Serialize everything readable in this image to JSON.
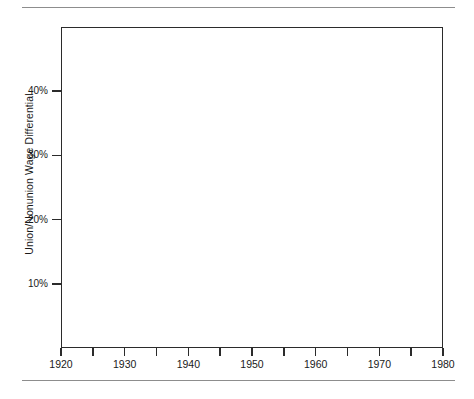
{
  "figure": {
    "has_top_rule": true,
    "has_bottom_rule": true,
    "rule_color": "#8d8d8d",
    "frame_color": "#2b2b2b",
    "background": "#ffffff"
  },
  "chart_data": {
    "type": "bar",
    "title": "",
    "subtitle": "",
    "xlabel": "",
    "ylabel": "Union/Nonunion Wage Differential",
    "xlim": [
      1920,
      1980
    ],
    "ylim": [
      0,
      50
    ],
    "grid": false,
    "legend": null,
    "y_tick_labels": [
      "10%",
      "20%",
      "30%",
      "40%"
    ],
    "y_ticks": [
      10,
      20,
      30,
      40
    ],
    "x_tick_labels": [
      "1920",
      "1930",
      "1940",
      "1950",
      "1960",
      "1970",
      "1980"
    ],
    "x_ticks": [
      1920,
      1930,
      1940,
      1950,
      1960,
      1970,
      1980
    ],
    "x_minor_ticks": [
      1925,
      1935,
      1945,
      1955,
      1965,
      1975
    ],
    "bar_width_years": 5,
    "categories": [
      "1920-1925",
      "1925-1930",
      "1930-1935",
      "1935-1940",
      "1940-1945",
      "1945-1950",
      "1950-1955",
      "1955-1960",
      "1960-1965",
      "1965-1970",
      "1970-1975",
      "1975-1980"
    ],
    "values": [
      17,
      26,
      46,
      22,
      6,
      2,
      12,
      16,
      25,
      19,
      19,
      30
    ],
    "data_labels": [
      "17%",
      "26%",
      "46%",
      "22%",
      "6%",
      "2%",
      "12%",
      "16%",
      "25%",
      "19%",
      "19%",
      "30%"
    ],
    "bars": [
      {
        "start": 1920,
        "end": 1925,
        "value": 17,
        "label": "17%"
      },
      {
        "start": 1925,
        "end": 1930,
        "value": 26,
        "label": "26%"
      },
      {
        "start": 1930,
        "end": 1935,
        "value": 46,
        "label": "46%"
      },
      {
        "start": 1935,
        "end": 1940,
        "value": 22,
        "label": "22%"
      },
      {
        "start": 1940,
        "end": 1945,
        "value": 6,
        "label": "6%"
      },
      {
        "start": 1945,
        "end": 1950,
        "value": 2,
        "label": "2%"
      },
      {
        "start": 1950,
        "end": 1955,
        "value": 12,
        "label": "12%"
      },
      {
        "start": 1955,
        "end": 1960,
        "value": 16,
        "label": "16%"
      },
      {
        "start": 1960,
        "end": 1965,
        "value": 25,
        "label": "25%"
      },
      {
        "start": 1965,
        "end": 1970,
        "value": 19,
        "label": "19%"
      },
      {
        "start": 1970,
        "end": 1975,
        "value": 19,
        "label": "19%"
      },
      {
        "start": 1975,
        "end": 1980,
        "value": 30,
        "label": "30%"
      }
    ]
  }
}
